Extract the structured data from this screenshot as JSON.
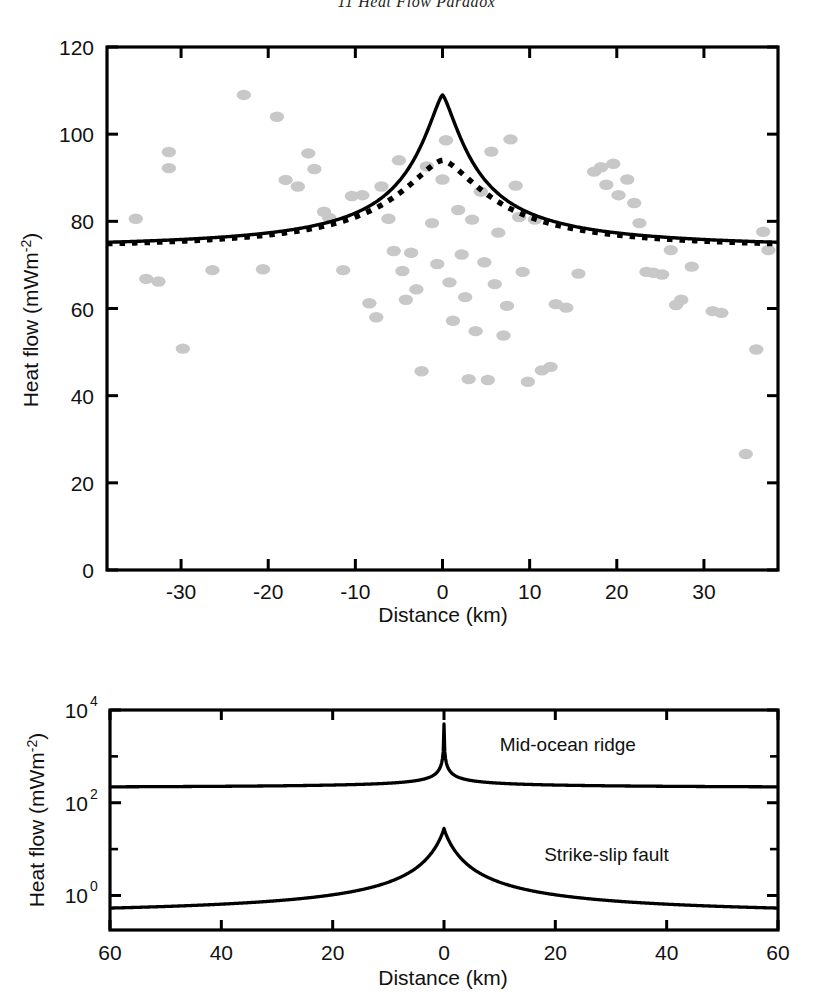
{
  "header": {
    "text": "11 Heat Flow Paradox"
  },
  "chart_data": [
    {
      "id": "top-panel",
      "type": "scatter",
      "title": "",
      "xlabel": "Distance (km)",
      "ylabel": "Heat flow (mWm-2)",
      "ylabel_base": "Heat flow (mWm",
      "ylabel_exp": "-2",
      "ylabel_tail": ")",
      "xlim": [
        -38.5,
        38.5
      ],
      "ylim": [
        0,
        120
      ],
      "xticks": [
        -30,
        -20,
        -10,
        0,
        10,
        20,
        30
      ],
      "xtick_labels": [
        "-30",
        "-20",
        "-10",
        "0",
        "10",
        "20",
        "30"
      ],
      "yticks": [
        0,
        20,
        40,
        60,
        80,
        100,
        120
      ],
      "ytick_labels": [
        "0",
        "20",
        "40",
        "60",
        "80",
        "100",
        "120"
      ],
      "grid": false,
      "legend": "none",
      "marker_color": "#c8c8c8",
      "scatter_points": [
        [
          -35.2,
          80.6
        ],
        [
          -34.0,
          66.8
        ],
        [
          -32.6,
          66.2
        ],
        [
          -31.4,
          95.9
        ],
        [
          -31.4,
          92.2
        ],
        [
          -29.8,
          50.8
        ],
        [
          -26.4,
          68.8
        ],
        [
          -22.8,
          109.0
        ],
        [
          -20.6,
          69.0
        ],
        [
          -19.0,
          104.0
        ],
        [
          -18.0,
          89.5
        ],
        [
          -16.6,
          88.0
        ],
        [
          -15.4,
          95.6
        ],
        [
          -14.7,
          92.0
        ],
        [
          -13.6,
          82.2
        ],
        [
          -13.0,
          80.8
        ],
        [
          -11.4,
          68.8
        ],
        [
          -10.4,
          85.8
        ],
        [
          -9.2,
          86.0
        ],
        [
          -8.4,
          61.2
        ],
        [
          -7.6,
          58.0
        ],
        [
          -7.0,
          88.0
        ],
        [
          -6.2,
          80.6
        ],
        [
          -5.6,
          73.2
        ],
        [
          -5.0,
          94.0
        ],
        [
          -4.6,
          68.6
        ],
        [
          -4.2,
          62.0
        ],
        [
          -3.6,
          72.8
        ],
        [
          -3.0,
          64.4
        ],
        [
          -2.4,
          45.6
        ],
        [
          -1.8,
          92.6
        ],
        [
          -1.2,
          79.6
        ],
        [
          -0.6,
          70.2
        ],
        [
          0.0,
          89.6
        ],
        [
          0.4,
          98.6
        ],
        [
          0.8,
          66.0
        ],
        [
          1.2,
          57.2
        ],
        [
          1.8,
          82.6
        ],
        [
          2.2,
          72.4
        ],
        [
          2.6,
          62.6
        ],
        [
          3.0,
          43.8
        ],
        [
          3.4,
          80.4
        ],
        [
          3.8,
          54.8
        ],
        [
          4.4,
          86.8
        ],
        [
          4.8,
          70.6
        ],
        [
          5.2,
          43.6
        ],
        [
          5.6,
          96.0
        ],
        [
          6.0,
          65.6
        ],
        [
          6.4,
          77.4
        ],
        [
          7.0,
          53.8
        ],
        [
          7.4,
          60.6
        ],
        [
          7.8,
          98.8
        ],
        [
          8.4,
          88.2
        ],
        [
          8.8,
          81.0
        ],
        [
          9.2,
          68.4
        ],
        [
          9.8,
          43.2
        ],
        [
          10.6,
          80.4
        ],
        [
          11.4,
          45.8
        ],
        [
          12.4,
          46.6
        ],
        [
          13.0,
          61.0
        ],
        [
          14.2,
          60.2
        ],
        [
          15.6,
          68.0
        ],
        [
          17.4,
          91.4
        ],
        [
          18.2,
          92.4
        ],
        [
          18.8,
          88.4
        ],
        [
          19.6,
          93.2
        ],
        [
          20.2,
          86.0
        ],
        [
          21.2,
          89.6
        ],
        [
          22.0,
          84.2
        ],
        [
          22.6,
          79.6
        ],
        [
          23.4,
          68.4
        ],
        [
          24.2,
          68.2
        ],
        [
          25.2,
          67.8
        ],
        [
          26.2,
          73.4
        ],
        [
          26.8,
          60.8
        ],
        [
          27.4,
          62.0
        ],
        [
          28.6,
          69.6
        ],
        [
          31.0,
          59.4
        ],
        [
          32.0,
          59.0
        ],
        [
          34.8,
          26.6
        ],
        [
          36.0,
          50.6
        ],
        [
          36.8,
          77.6
        ],
        [
          37.4,
          73.4
        ]
      ],
      "series": [
        {
          "name": "solid-model",
          "style": "solid",
          "color": "#000000",
          "background_value": 73.5,
          "peak_value": 109.0,
          "halfwidth_km": 4.2
        },
        {
          "name": "dotted-model",
          "style": "dotted",
          "color": "#000000",
          "background_value": 73.5,
          "peak_value": 94.0,
          "halfwidth_km": 7.0
        }
      ]
    },
    {
      "id": "bottom-panel",
      "type": "line",
      "title": "",
      "xlabel": "Distance (km)",
      "ylabel": "Heat flow (mWm-2)",
      "ylabel_base": "Heat flow (mWm",
      "ylabel_exp": "-2",
      "ylabel_tail": ")",
      "yscale": "log",
      "xlim": [
        -60,
        60
      ],
      "ylim": [
        0.18,
        10000
      ],
      "xticks": [
        -60,
        -40,
        -20,
        0,
        20,
        40,
        60
      ],
      "xtick_labels": [
        "60",
        "40",
        "20",
        "0",
        "20",
        "40",
        "60"
      ],
      "yticks": [
        1,
        100,
        10000
      ],
      "ytick_labels": [
        "10",
        "10",
        "10"
      ],
      "ytick_exponents": [
        "0",
        "2",
        "4"
      ],
      "yminor_ticks": [
        10,
        1000
      ],
      "grid": false,
      "legend": "inline-annotations",
      "series": [
        {
          "name": "Mid-ocean ridge",
          "style": "solid",
          "color": "#000000",
          "edge_value": 200,
          "peak_value": 5000,
          "label_x_km": 10,
          "label_y_value": 1300
        },
        {
          "name": "Strike-slip fault",
          "style": "solid",
          "color": "#000000",
          "edge_value": 0.32,
          "peak_value": 28,
          "label_x_km": 18,
          "label_y_value": 5.5
        }
      ],
      "annotations": [
        {
          "text": "Mid-ocean ridge",
          "x_km": 10,
          "y_value": 1300
        },
        {
          "text": "Strike-slip fault",
          "x_km": 18,
          "y_value": 5.5
        }
      ]
    }
  ]
}
